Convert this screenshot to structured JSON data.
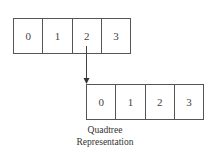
{
  "diagram": {
    "top_array": {
      "cells": [
        "0",
        "1",
        "2",
        "3"
      ]
    },
    "bottom_array": {
      "cells": [
        "0",
        "1",
        "2",
        "3"
      ]
    },
    "arrow": {
      "from": "top_array.cells.2",
      "to": "bottom_array"
    },
    "caption": {
      "line1": "Quadtree",
      "line2": "Representation"
    },
    "colors": {
      "stroke": "#555555",
      "text": "#333333",
      "background": "#ffffff"
    }
  }
}
